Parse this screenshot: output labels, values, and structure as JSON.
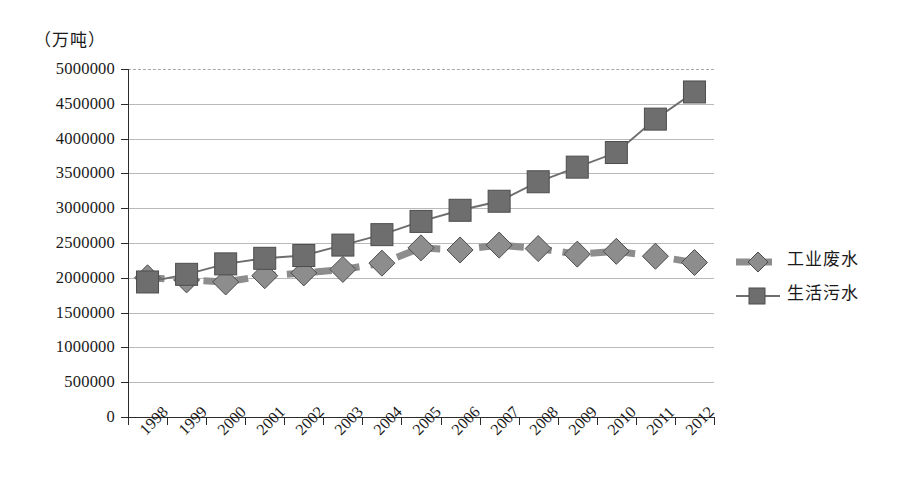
{
  "axis": {
    "unit_caption": "（万吨）",
    "y_ticks": [
      "5000000",
      "4500000",
      "4000000",
      "3500000",
      "3000000",
      "2500000",
      "2000000",
      "1500000",
      "1000000",
      "500000",
      "0"
    ],
    "x_ticks": [
      "1998",
      "1999",
      "2000",
      "2001",
      "2002",
      "2003",
      "2004",
      "2005",
      "2006",
      "2007",
      "2008",
      "2009",
      "2010",
      "2011",
      "2012"
    ]
  },
  "legend": {
    "items": [
      {
        "label": "工业废水",
        "marker": "diamond-marker",
        "color": "#8d8d8d",
        "line": "dashed-thick"
      },
      {
        "label": "生活污水",
        "marker": "square-marker",
        "color": "#6e6e6e",
        "line": "solid-thin"
      }
    ]
  },
  "chart_data": {
    "type": "line",
    "title": "",
    "subtitle": "",
    "xlabel": "",
    "ylabel": "（万吨）",
    "ylim": [
      0,
      5000000
    ],
    "ytick_step": 500000,
    "grid": true,
    "legend_position": "right",
    "categories": [
      "1998",
      "1999",
      "2000",
      "2001",
      "2002",
      "2003",
      "2004",
      "2005",
      "2006",
      "2007",
      "2008",
      "2009",
      "2010",
      "2011",
      "2012"
    ],
    "series": [
      {
        "name": "工业废水",
        "color": "#8d8d8d",
        "marker": "diamond",
        "linestyle": "dashed",
        "values": [
          2000000,
          1970000,
          1940000,
          2030000,
          2070000,
          2120000,
          2210000,
          2430000,
          2400000,
          2470000,
          2420000,
          2340000,
          2380000,
          2310000,
          2220000
        ]
      },
      {
        "name": "生活污水",
        "color": "#6e6e6e",
        "marker": "square",
        "linestyle": "solid",
        "values": [
          1940000,
          2050000,
          2200000,
          2280000,
          2320000,
          2470000,
          2620000,
          2810000,
          2970000,
          3100000,
          3380000,
          3590000,
          3800000,
          4280000,
          4670000
        ]
      }
    ]
  }
}
